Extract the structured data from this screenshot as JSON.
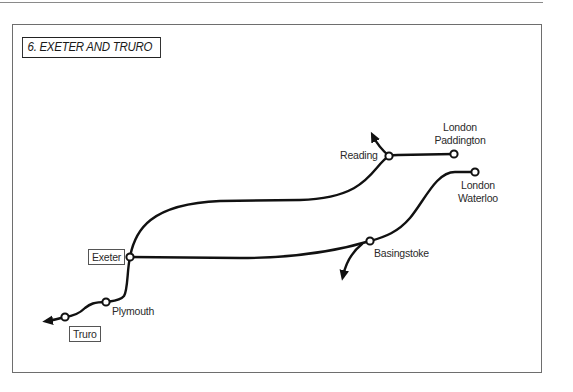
{
  "title": "6. EXETER AND TRURO",
  "colors": {
    "line": "#111111",
    "frame": "#6e6e6e",
    "text": "#2a2a2a",
    "background": "#ffffff"
  },
  "stations": [
    {
      "id": "london-paddington",
      "line1": "London",
      "line2": "Paddington",
      "x": 454,
      "y": 154
    },
    {
      "id": "reading",
      "label": "Reading",
      "x": 389,
      "y": 156
    },
    {
      "id": "london-waterloo",
      "line1": "London",
      "line2": "Waterloo",
      "x": 475,
      "y": 172
    },
    {
      "id": "basingstoke",
      "label": "Basingstoke",
      "x": 370,
      "y": 241
    },
    {
      "id": "exeter",
      "label": "Exeter",
      "boxed": true,
      "x": 130,
      "y": 257
    },
    {
      "id": "plymouth",
      "label": "Plymouth",
      "x": 106,
      "y": 302
    },
    {
      "id": "truro",
      "label": "Truro",
      "boxed": true,
      "x": 65,
      "y": 317
    }
  ],
  "routes": [
    {
      "name": "Paddington-Reading-Exeter"
    },
    {
      "name": "Waterloo-Basingstoke-Exeter"
    },
    {
      "name": "Exeter-Plymouth-Truro"
    }
  ],
  "branches": [
    {
      "from": "reading",
      "direction": "north-west"
    },
    {
      "from": "basingstoke",
      "direction": "south-west"
    },
    {
      "from": "truro",
      "direction": "west"
    }
  ]
}
